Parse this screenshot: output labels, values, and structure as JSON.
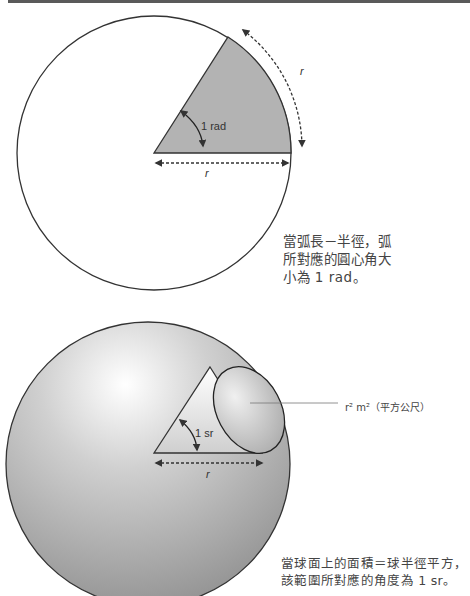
{
  "header_bar": {
    "color": "#5a5a5a"
  },
  "radian_figure": {
    "angle_label": "1 rad",
    "radius_label": "r",
    "arc_label": "r",
    "sector_color": "#b3b3b3",
    "caption": "當弧長－半徑，弧所對應的圓心角大小為 1 rad。"
  },
  "steradian_figure": {
    "angle_label": "1 sr",
    "radius_label": "r",
    "area_label": "r² m²（平方公尺）",
    "sphere_color": "#a8a8a8",
    "caption_line1": "當球面上的面積＝球半徑平方，",
    "caption_line2": "該範圍所對應的角度為 1 sr。"
  }
}
